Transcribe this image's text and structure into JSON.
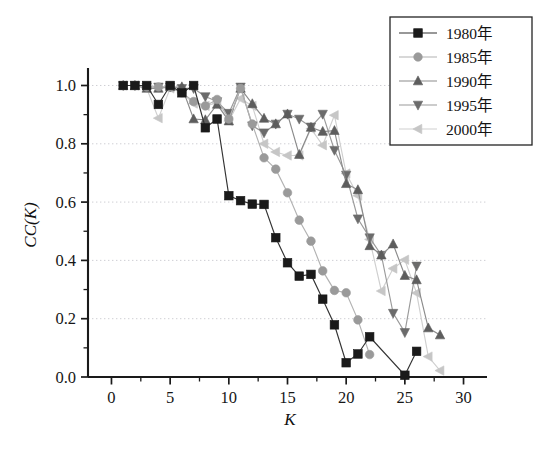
{
  "chart_data": {
    "type": "line",
    "title": "",
    "xlabel": "K",
    "ylabel": "CC(K)",
    "xlim": [
      -2,
      32
    ],
    "ylim": [
      0.0,
      1.06
    ],
    "xticks": [
      0,
      5,
      10,
      15,
      20,
      25,
      30
    ],
    "yticks": [
      "0.0",
      "0.2",
      "0.4",
      "0.6",
      "0.8",
      "1.0"
    ],
    "ytick_values": [
      0.0,
      0.2,
      0.4,
      0.6,
      0.8,
      1.0
    ],
    "grid": "horizontal-dotted",
    "legend_position": "top-right",
    "series": [
      {
        "name": "1980年",
        "marker": "square",
        "color": "#1a1a1a",
        "line_color": "#333333",
        "x": [
          1,
          2,
          3,
          4,
          5,
          6,
          7,
          8,
          9,
          10,
          11,
          12,
          13,
          14,
          15,
          16,
          17,
          18,
          19,
          20,
          21,
          22,
          25,
          26
        ],
        "y": [
          1.0,
          1.0,
          1.0,
          0.935,
          1.0,
          0.975,
          1.0,
          0.855,
          0.885,
          0.622,
          0.605,
          0.593,
          0.592,
          0.478,
          0.392,
          0.346,
          0.352,
          0.267,
          0.179,
          0.049,
          0.079,
          0.138,
          0.006,
          0.088
        ]
      },
      {
        "name": "1985年",
        "marker": "circle",
        "color": "#9a9a9a",
        "line_color": "#b2b2b2",
        "x": [
          1,
          2,
          3,
          4,
          5,
          6,
          7,
          8,
          9,
          10,
          11,
          12,
          13,
          14,
          15,
          16,
          17,
          18,
          19,
          20,
          21,
          22
        ],
        "y": [
          1.0,
          1.0,
          0.995,
          0.995,
          0.995,
          0.975,
          0.945,
          0.93,
          0.952,
          0.885,
          0.99,
          0.868,
          0.752,
          0.713,
          0.632,
          0.538,
          0.466,
          0.364,
          0.297,
          0.289,
          0.196,
          0.077
        ]
      },
      {
        "name": "1990年",
        "marker": "triangle-up",
        "color": "#5d5d5d",
        "line_color": "#8b8b8b",
        "x": [
          1,
          2,
          3,
          4,
          5,
          6,
          7,
          8,
          9,
          10,
          11,
          12,
          13,
          14,
          15,
          16,
          17,
          18,
          19,
          20,
          21,
          22,
          23,
          24,
          25,
          26,
          27,
          28
        ],
        "y": [
          1.0,
          1.0,
          0.99,
          0.99,
          0.995,
          0.995,
          0.885,
          0.882,
          0.935,
          0.878,
          0.99,
          0.937,
          0.887,
          0.868,
          0.902,
          0.763,
          0.856,
          0.842,
          0.845,
          0.663,
          0.642,
          0.45,
          0.418,
          0.456,
          0.348,
          0.333,
          0.168,
          0.144
        ]
      },
      {
        "name": "1995年",
        "marker": "triangle-down",
        "color": "#6b6b6b",
        "line_color": "#9a9a9a",
        "x": [
          1,
          2,
          3,
          4,
          5,
          6,
          7,
          8,
          9,
          10,
          11,
          12,
          13,
          14,
          15,
          16,
          17,
          18,
          19,
          20,
          21,
          22,
          23,
          24,
          25,
          26
        ],
        "y": [
          1.0,
          1.0,
          0.995,
          0.995,
          0.995,
          0.99,
          0.99,
          0.962,
          0.945,
          0.905,
          0.995,
          0.862,
          0.838,
          0.868,
          0.902,
          0.885,
          0.858,
          0.902,
          0.778,
          0.693,
          0.543,
          0.478,
          0.418,
          0.219,
          0.153,
          0.381
        ]
      },
      {
        "name": "2000年",
        "marker": "triangle-left",
        "color": "#c6c6c6",
        "line_color": "#cfcfcf",
        "x": [
          1,
          2,
          3,
          4,
          5,
          6,
          7,
          8,
          9,
          10,
          11,
          12,
          13,
          14,
          15,
          16,
          17,
          18,
          19,
          20,
          21,
          22,
          23,
          24,
          25,
          26,
          27,
          28
        ],
        "y": [
          1.0,
          1.0,
          0.99,
          0.888,
          0.99,
          0.975,
          0.938,
          0.93,
          0.94,
          0.878,
          0.955,
          0.93,
          0.8,
          0.772,
          0.76,
          0.76,
          0.852,
          0.795,
          0.898,
          0.698,
          0.622,
          0.472,
          0.295,
          0.372,
          0.402,
          0.288,
          0.07,
          0.022
        ]
      }
    ]
  },
  "legend": {
    "items": [
      {
        "label": "1980年",
        "marker": "square"
      },
      {
        "label": "1985年",
        "marker": "circle"
      },
      {
        "label": "1990年",
        "marker": "triangle-up"
      },
      {
        "label": "1995年",
        "marker": "triangle-down"
      },
      {
        "label": "2000年",
        "marker": "triangle-left"
      }
    ]
  },
  "colors": {
    "background": "#ffffff",
    "axis": "#1a1a1a",
    "grid": "#c9c9cf"
  }
}
